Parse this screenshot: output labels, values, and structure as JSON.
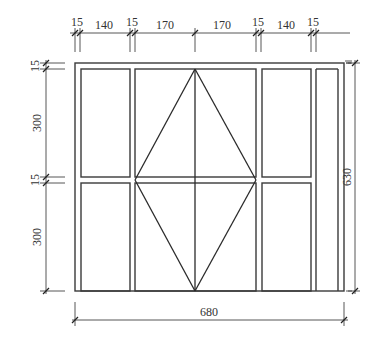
{
  "drawing": {
    "type": "window elevation",
    "top_dimensions": [
      "15",
      "140",
      "15",
      "170",
      "170",
      "15",
      "140",
      "15"
    ],
    "left_dimensions": [
      "15",
      "300",
      "15",
      "300"
    ],
    "right_dimension": "630",
    "bottom_dimension": "680",
    "colors": {
      "line": "#3a3a3a",
      "background": "#ffffff"
    }
  }
}
